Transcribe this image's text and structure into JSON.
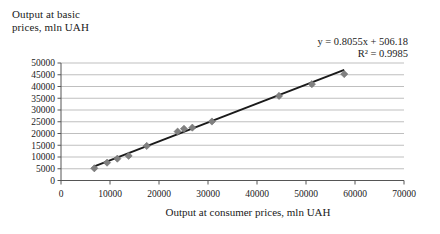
{
  "chart_data": {
    "type": "scatter",
    "title": "",
    "xlabel": "Output at consumer prices, mln UAH",
    "ylabel": "Output at basic prices, mln UAH",
    "xlim": [
      0,
      70000
    ],
    "ylim": [
      0,
      50000
    ],
    "xticks": [
      0,
      10000,
      20000,
      30000,
      40000,
      50000,
      60000,
      70000
    ],
    "yticks": [
      0,
      5000,
      10000,
      15000,
      20000,
      25000,
      30000,
      35000,
      40000,
      45000,
      50000
    ],
    "xtick_labels": [
      "0",
      "10000",
      "20000",
      "30000",
      "40000",
      "50000",
      "60000",
      "70000"
    ],
    "ytick_labels": [
      "0",
      "5000",
      "10000",
      "15000",
      "20000",
      "25000",
      "30000",
      "35000",
      "40000",
      "45000",
      "50000"
    ],
    "grid": "horizontal",
    "legend": "none",
    "marker": "diamond",
    "marker_color": "#808080",
    "trendline_color": "#1a1a1a",
    "series": [
      {
        "name": "Output",
        "points": [
          [
            6800,
            5200
          ],
          [
            9400,
            7600
          ],
          [
            11500,
            9300
          ],
          [
            13800,
            10500
          ],
          [
            17500,
            14700
          ],
          [
            23800,
            20800
          ],
          [
            25100,
            22000
          ],
          [
            26800,
            22500
          ],
          [
            30800,
            25100
          ],
          [
            44500,
            36000
          ],
          [
            51200,
            41000
          ],
          [
            57800,
            45300
          ]
        ]
      }
    ],
    "trendline": {
      "type": "linear",
      "slope": 0.8055,
      "intercept": 506.18,
      "equation": "y = 0.8055x + 506.18",
      "r_squared_label": "R² = 0.9985",
      "r_squared": 0.9985
    },
    "annotations": [
      "y = 0.8055x + 506.18",
      "R² = 0.9985"
    ]
  },
  "axes": {
    "y_title": "Output at basic\nprices, mln UAH",
    "x_title": "Output at consumer prices, mln UAH"
  },
  "equation": {
    "line1": "y = 0.8055x + 506.18",
    "line2": "R² = 0.9985"
  }
}
